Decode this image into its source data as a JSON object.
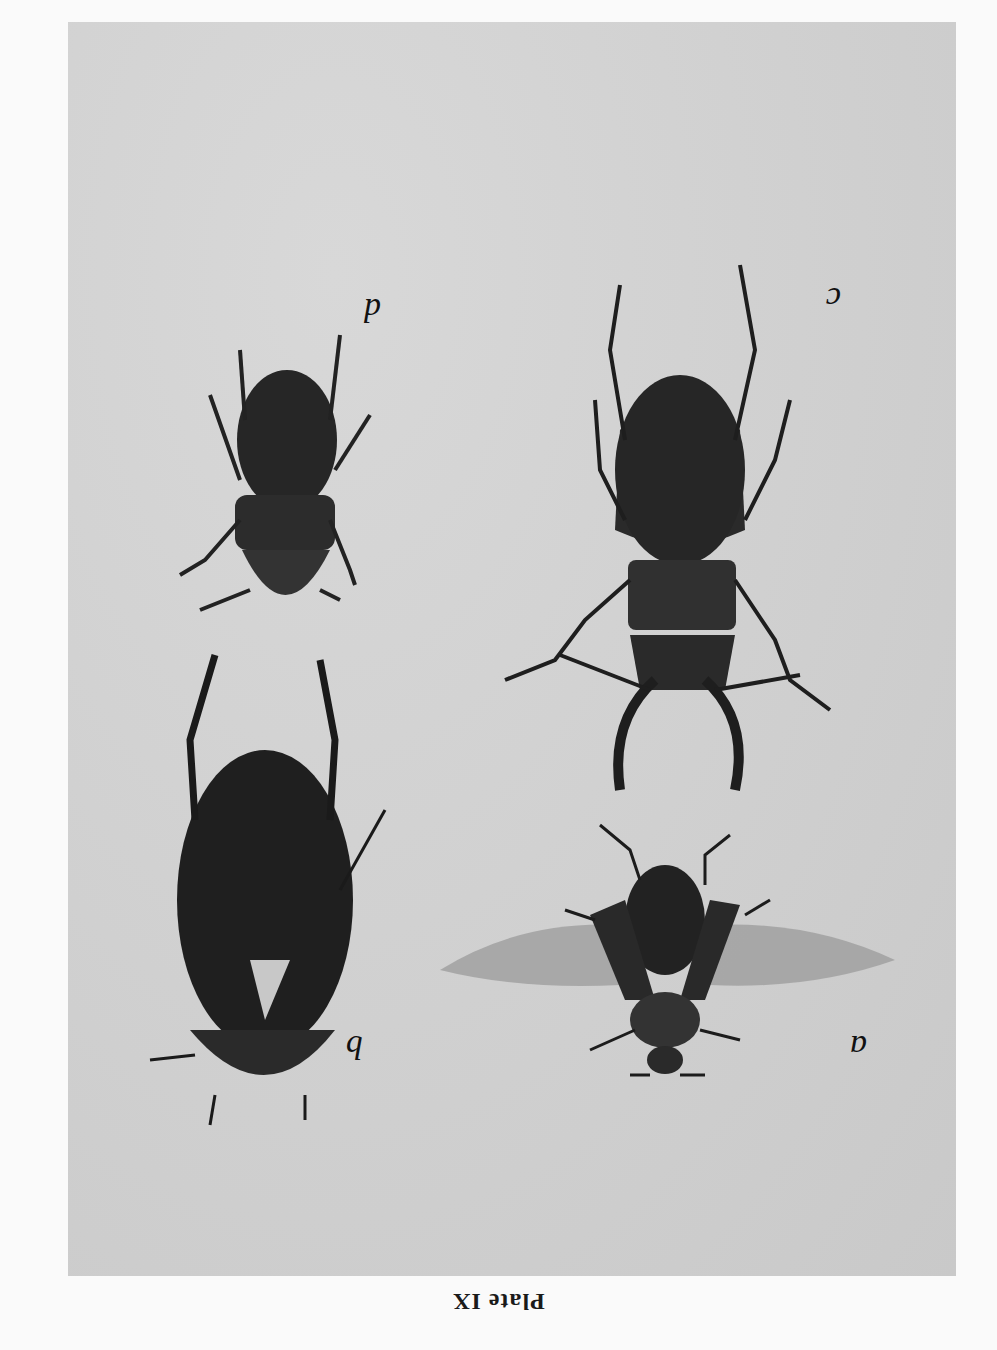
{
  "plate": {
    "caption": "Plate IX",
    "orientation": "rotated 180°",
    "background_color": "#d2d2d2",
    "page_color": "#fafafa"
  },
  "specimens": [
    {
      "label": "a",
      "description": "beetle, ventral view with wings spread"
    },
    {
      "label": "b",
      "description": "large oval water beetle"
    },
    {
      "label": "c",
      "description": "stag beetle with mandibles"
    },
    {
      "label": "d",
      "description": "small stag beetle"
    }
  ]
}
